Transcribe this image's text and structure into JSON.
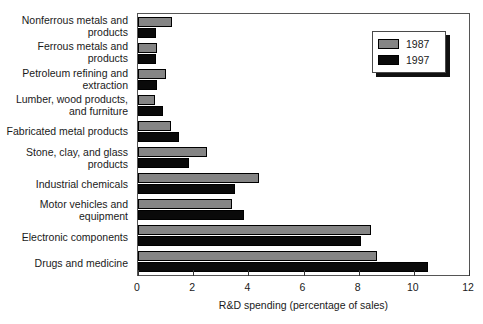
{
  "chart_data": {
    "type": "bar",
    "orientation": "horizontal",
    "title": "",
    "xlabel": "R&D spending (percentage of sales)",
    "ylabel": "",
    "xlim": [
      0,
      12
    ],
    "xticks": [
      0,
      2,
      4,
      6,
      8,
      10,
      12
    ],
    "xtick_labels": [
      "0",
      "2",
      "4",
      "6",
      "8",
      "10",
      "12"
    ],
    "grid": false,
    "legend_position": "top-right",
    "categories": [
      "Nonferrous metals and\nproducts",
      "Ferrous metals and\nproducts",
      "Petroleum refining and\nextraction",
      "Lumber, wood products,\nand furniture",
      "Fabricated metal products",
      "Stone, clay, and glass\nproducts",
      "Industrial chemicals",
      "Motor vehicles and\nequipment",
      "Electronic components",
      "Drugs and medicine"
    ],
    "series": [
      {
        "name": "1987",
        "color": "#858585",
        "values": [
          1.25,
          0.7,
          1.0,
          0.6,
          1.2,
          2.5,
          4.4,
          3.4,
          8.45,
          8.65
        ]
      },
      {
        "name": "1997",
        "color": "#0a0a0a",
        "values": [
          0.65,
          0.65,
          0.7,
          0.9,
          1.5,
          1.85,
          3.5,
          3.85,
          8.1,
          10.5
        ]
      }
    ]
  },
  "legend": {
    "entries": [
      {
        "label": "1987",
        "color": "#858585"
      },
      {
        "label": "1997",
        "color": "#0a0a0a"
      }
    ]
  }
}
